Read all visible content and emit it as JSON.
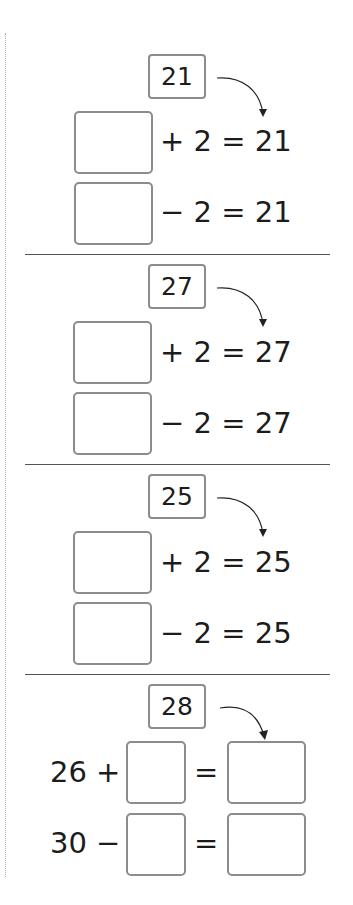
{
  "worksheet": {
    "colors": {
      "box_border": "#8c8c8c",
      "text": "#1c1c1c",
      "divider": "#555555",
      "margin_dots": "#b0b0b0"
    },
    "sections": [
      {
        "given": "21",
        "rows": [
          {
            "operator": "+",
            "operand": "2",
            "equals": "=",
            "result": "21",
            "text": "+ 2 = 21"
          },
          {
            "operator": "−",
            "operand": "2",
            "equals": "=",
            "result": "21",
            "text": "− 2 = 21"
          }
        ]
      },
      {
        "given": "27",
        "rows": [
          {
            "operator": "+",
            "operand": "2",
            "equals": "=",
            "result": "27",
            "text": "+ 2 = 27"
          },
          {
            "operator": "−",
            "operand": "2",
            "equals": "=",
            "result": "27",
            "text": "− 2 = 27"
          }
        ]
      },
      {
        "given": "25",
        "rows": [
          {
            "operator": "+",
            "operand": "2",
            "equals": "=",
            "result": "25",
            "text": "+ 2 = 25"
          },
          {
            "operator": "−",
            "operand": "2",
            "equals": "=",
            "result": "25",
            "text": "− 2 = 25"
          }
        ]
      },
      {
        "given": "28",
        "rows": [
          {
            "left": "26",
            "operator": "+",
            "lead": "26 +",
            "equals": "="
          },
          {
            "left": "30",
            "operator": "−",
            "lead": "30 −",
            "equals": "="
          }
        ]
      }
    ]
  }
}
